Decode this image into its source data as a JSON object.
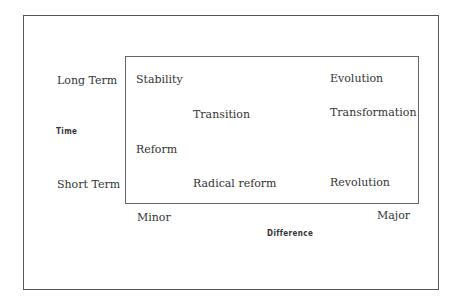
{
  "diagram": {
    "y_axis": {
      "title": "Time",
      "top_label": "Long Term",
      "bottom_label": "Short Term"
    },
    "x_axis": {
      "title": "Difference",
      "left_label": "Minor",
      "right_label": "Major"
    },
    "cells": [
      {
        "label": "Stability"
      },
      {
        "label": "Evolution"
      },
      {
        "label": "Transition"
      },
      {
        "label": "Transformation"
      },
      {
        "label": "Reform"
      },
      {
        "label": "Radical reform"
      },
      {
        "label": "Revolution"
      }
    ]
  }
}
